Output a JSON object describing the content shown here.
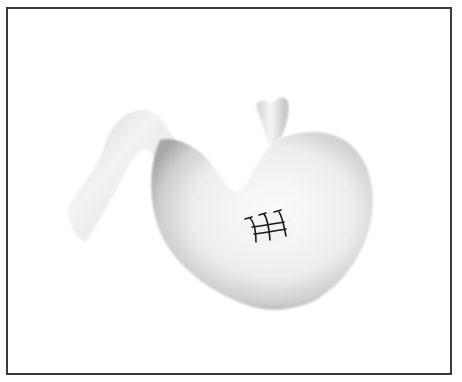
{
  "figure": {
    "caption": "",
    "parts": [
      "esophagus",
      "stomach",
      "duodenum",
      "sutures"
    ],
    "suture_count": 3,
    "colors": {
      "frame": "#3a3a3a",
      "background": "#ffffff",
      "organ_light": "#f7f7f7",
      "organ_shade": "#9a9a9a",
      "suture": "#1a1a1a"
    }
  }
}
